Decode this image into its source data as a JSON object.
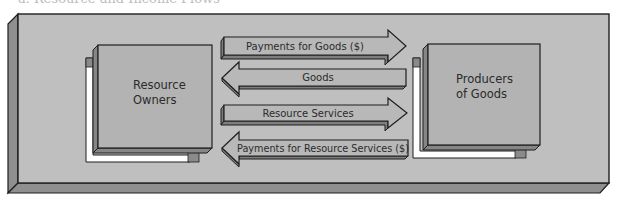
{
  "caption": "a. Resource and Income Flows",
  "colors": {
    "plate_face": "#bfbfbf",
    "plate_side": "#8f8f8f",
    "box_face": "#b3b3b3",
    "box_side": "#868686",
    "arrow_face": "#b8b8b8",
    "arrow_side": "#7e7e7e",
    "outline": "#1e1e1e",
    "shadow_frame": "#ffffff",
    "shadow_tab": "#8a8a8a"
  },
  "nodes": [
    {
      "id": "resource-owners",
      "lines": [
        "Resource",
        "Owners"
      ]
    },
    {
      "id": "producers-of-goods",
      "lines": [
        "Producers",
        "of Goods"
      ]
    }
  ],
  "flows": [
    {
      "label": "Payments for Goods ($)",
      "direction": "right",
      "from": "Resource Owners",
      "to": "Producers of Goods"
    },
    {
      "label": "Goods",
      "direction": "left",
      "from": "Producers of Goods",
      "to": "Resource Owners"
    },
    {
      "label": "Resource Services",
      "direction": "right",
      "from": "Resource Owners",
      "to": "Producers of Goods"
    },
    {
      "label": "Payments for Resource Services ($)",
      "direction": "left",
      "from": "Producers of Goods",
      "to": "Resource Owners"
    }
  ]
}
